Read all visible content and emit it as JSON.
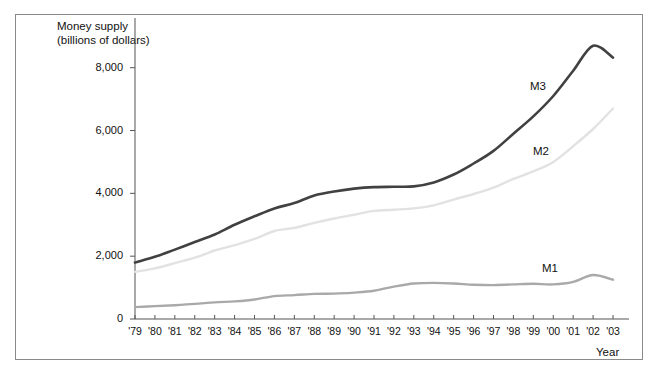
{
  "chart_data": {
    "type": "line",
    "title": "Money supply",
    "subtitle": "(billions of dollars)",
    "ylabel": "Money supply (billions of dollars)",
    "xlabel": "Year",
    "grid": false,
    "legend_position": "inline-right",
    "ylim": [
      0,
      9200
    ],
    "yticks": [
      0,
      2000,
      4000,
      6000,
      8000
    ],
    "ytick_labels": [
      "0",
      "2,000",
      "4,000",
      "6,000",
      "8,000"
    ],
    "categories": [
      "'79",
      "'80",
      "'81",
      "'82",
      "'83",
      "'84",
      "'85",
      "'86",
      "'87",
      "'88",
      "'89",
      "'90",
      "'91",
      "'92",
      "'93",
      "'94",
      "'95",
      "'96",
      "'97",
      "'98",
      "'99",
      "'00",
      "'01",
      "'02",
      "'03"
    ],
    "series": [
      {
        "name": "M3",
        "color": "#414141",
        "width": 2.6,
        "values": [
          1800,
          1980,
          2210,
          2450,
          2690,
          3000,
          3270,
          3520,
          3690,
          3930,
          4060,
          4150,
          4200,
          4210,
          4220,
          4350,
          4600,
          4950,
          5350,
          5900,
          6450,
          7100,
          7900,
          8700,
          8320
        ]
      },
      {
        "name": "M2",
        "color": "#e2e2e2",
        "width": 2.4,
        "values": [
          1500,
          1610,
          1780,
          1950,
          2180,
          2350,
          2550,
          2800,
          2900,
          3060,
          3200,
          3320,
          3440,
          3480,
          3520,
          3620,
          3800,
          3980,
          4180,
          4460,
          4700,
          5000,
          5500,
          6050,
          6700
        ]
      },
      {
        "name": "M1",
        "color": "#a9a9a9",
        "width": 2.4,
        "values": [
          380,
          410,
          440,
          480,
          530,
          560,
          620,
          730,
          760,
          800,
          810,
          840,
          900,
          1030,
          1130,
          1150,
          1130,
          1090,
          1080,
          1100,
          1120,
          1100,
          1180,
          1400,
          1250
        ]
      }
    ],
    "series_labels": [
      {
        "name": "M3",
        "x": 530,
        "y": 80
      },
      {
        "name": "M2",
        "x": 533,
        "y": 145
      },
      {
        "name": "M1",
        "x": 542,
        "y": 262
      }
    ]
  }
}
